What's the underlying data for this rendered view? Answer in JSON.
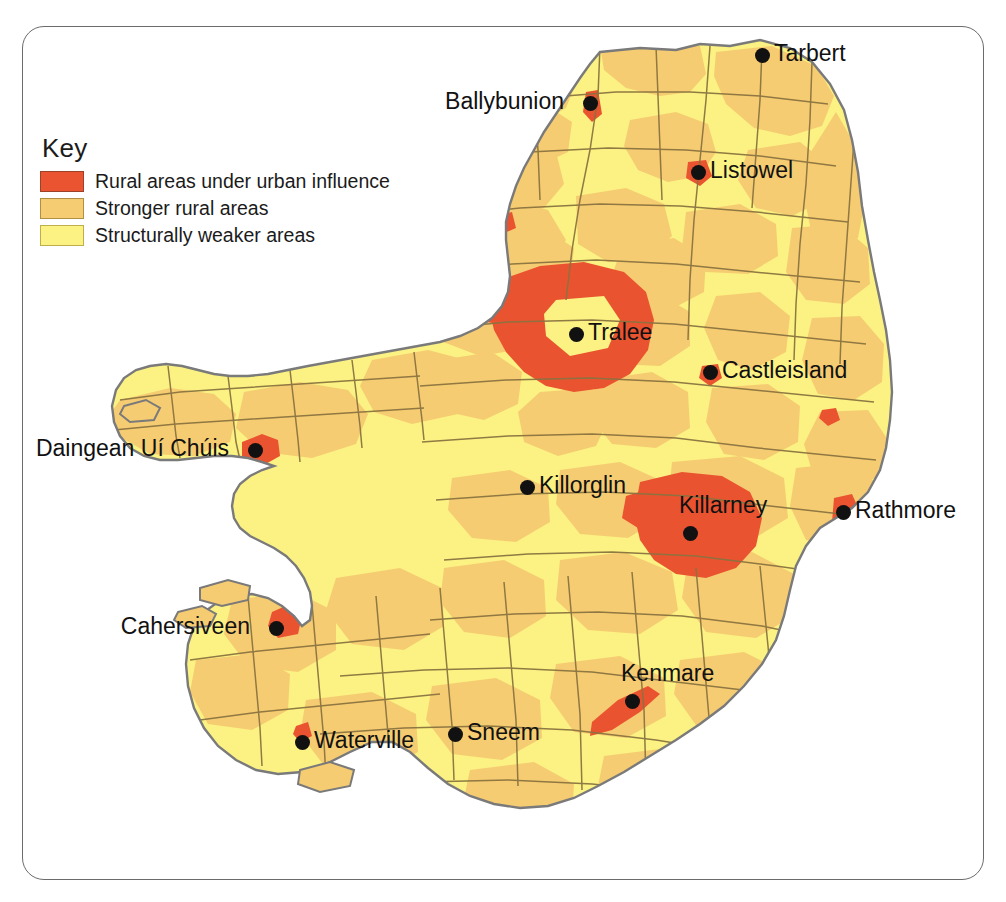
{
  "map": {
    "title": "County Kerry rural area classification map",
    "region": "County Kerry, Ireland",
    "background_color": "#ffffff",
    "frame_color": "#6b6b6b",
    "border_color": "#7a7a7a",
    "district_line_color": "#7a6a3d"
  },
  "legend": {
    "title": "Key",
    "items": [
      {
        "label": "Rural areas under urban influence",
        "color": "#ea5431",
        "swatch": "red"
      },
      {
        "label": "Stronger rural areas",
        "color": "#f6cc72",
        "swatch": "tan"
      },
      {
        "label": "Structurally weaker areas",
        "color": "#fbf283",
        "swatch": "yellow"
      }
    ]
  },
  "places": [
    {
      "name": "Tarbert",
      "x": 762,
      "y": 55,
      "label_side": "right"
    },
    {
      "name": "Ballybunion",
      "x": 590,
      "y": 103,
      "label_side": "left"
    },
    {
      "name": "Listowel",
      "x": 698,
      "y": 172,
      "label_side": "right"
    },
    {
      "name": "Tralee",
      "x": 576,
      "y": 334,
      "label_side": "right"
    },
    {
      "name": "Castleisland",
      "x": 710,
      "y": 372,
      "label_side": "right"
    },
    {
      "name": "Daingean Uí Chúis",
      "x": 255,
      "y": 450,
      "label_side": "left"
    },
    {
      "name": "Killorglin",
      "x": 527,
      "y": 487,
      "label_side": "right"
    },
    {
      "name": "Rathmore",
      "x": 843,
      "y": 512,
      "label_side": "right"
    },
    {
      "name": "Killarney",
      "x": 690,
      "y": 533,
      "label_side": "above"
    },
    {
      "name": "Cahersiveen",
      "x": 276,
      "y": 628,
      "label_side": "left"
    },
    {
      "name": "Kenmare",
      "x": 632,
      "y": 701,
      "label_side": "above"
    },
    {
      "name": "Sneem",
      "x": 455,
      "y": 734,
      "label_side": "right"
    },
    {
      "name": "Waterville",
      "x": 302,
      "y": 742,
      "label_side": "right"
    }
  ]
}
